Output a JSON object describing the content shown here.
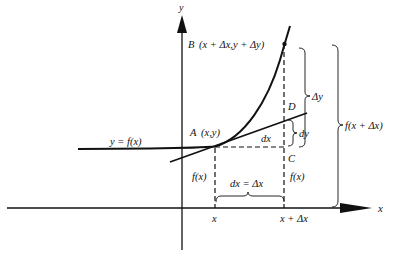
{
  "diagram": {
    "axes": {
      "x_label": "x",
      "y_label": "y"
    },
    "curve_label": "y = f(x)",
    "points": {
      "A": {
        "label": "A",
        "coords": "(x,y)"
      },
      "B": {
        "label": "B",
        "coords": "(x + Δx,y + Δy)"
      },
      "C": {
        "label": "C"
      },
      "D": {
        "label": "D"
      }
    },
    "labels": {
      "dx_segment": "dx",
      "dy": "dy",
      "delta_y": "Δy",
      "f_x_plus_dx": "f(x + Δx)",
      "f_x_left": "f(x)",
      "f_x_right": "f(x)",
      "dx_equals": "dx = Δx",
      "tick_x": "x",
      "tick_x_plus_dx": "x + Δx"
    },
    "colors": {
      "ink": "#111111",
      "background": "#ffffff"
    }
  }
}
